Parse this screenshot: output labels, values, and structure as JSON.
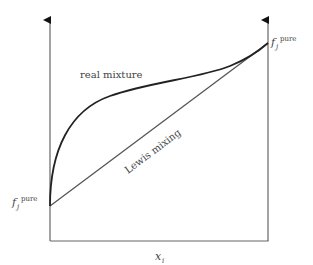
{
  "diagram": {
    "curves": [
      {
        "name": "real mixture",
        "label": "real mixture",
        "color": "#222222"
      },
      {
        "name": "Lewis mixing",
        "label": "Lewis mixing",
        "color": "#555555"
      }
    ],
    "axis": {
      "xlabel_main": "x",
      "xlabel_sub": "i",
      "color": "#666666"
    },
    "left_label": {
      "main": "f",
      "sub": "j",
      "sup": "pure"
    },
    "right_label": {
      "main": "f",
      "sub": "j",
      "sup": "pure"
    }
  }
}
